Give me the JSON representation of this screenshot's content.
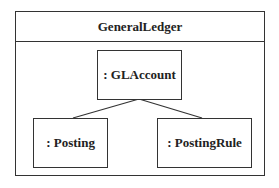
{
  "package": {
    "name": "GeneralLedger"
  },
  "objects": [
    {
      "id": "glaccount",
      "label": ": GLAccount"
    },
    {
      "id": "posting",
      "label": ": Posting"
    },
    {
      "id": "postingrule",
      "label": ": PostingRule"
    }
  ],
  "links": [
    {
      "from": "glaccount",
      "to": "posting"
    },
    {
      "from": "glaccount",
      "to": "postingrule"
    }
  ]
}
